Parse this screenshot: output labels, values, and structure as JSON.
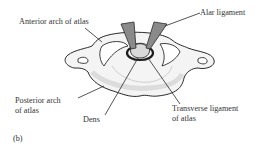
{
  "figure": {
    "panel_label": "(b)"
  },
  "labels": {
    "anterior_arch": "Anterior arch of atlas",
    "alar_ligament": "Alar ligament",
    "posterior_arch_line1": "Posterior arch",
    "posterior_arch_line2": "of atlas",
    "dens": "Dens",
    "transverse_ligament_line1": "Transverse ligament",
    "transverse_ligament_line2": "of atlas"
  },
  "colors": {
    "outline": "#2a2a2a",
    "bone_fill": "#f2f2f2",
    "ligament_fill": "#8a8a8a",
    "text": "#333333"
  }
}
